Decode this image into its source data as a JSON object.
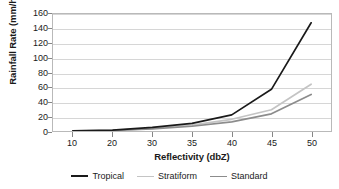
{
  "chart_data": {
    "type": "line",
    "title": "",
    "xlabel": "Reflectivity (dbZ)",
    "ylabel": "Rainfall Rate (mm/hr)",
    "categories": [
      "10",
      "20",
      "30",
      "35",
      "40",
      "45",
      "50"
    ],
    "x": [
      10,
      20,
      30,
      35,
      40,
      45,
      50
    ],
    "ylim": [
      0,
      160
    ],
    "yticks": [
      0,
      20,
      40,
      60,
      80,
      100,
      120,
      140,
      160
    ],
    "ytick_labels": [
      "0",
      "20",
      "40",
      "60",
      "80",
      "100",
      "120",
      "140",
      "160"
    ],
    "grid": true,
    "grid_axis": "y",
    "legend_position": "bottom",
    "series": [
      {
        "name": "Tropical",
        "color": "#1a1a1a",
        "width": 1.7,
        "values": [
          0.3,
          1.2,
          5.0,
          10.5,
          22.0,
          57.0,
          148.0
        ]
      },
      {
        "name": "Stratiform",
        "color": "#c4c4c4",
        "width": 1.7,
        "values": [
          0.2,
          0.8,
          3.5,
          8.0,
          16.0,
          29.0,
          64.0
        ]
      },
      {
        "name": "Standard",
        "color": "#8c8c8c",
        "width": 1.7,
        "values": [
          0.2,
          0.7,
          3.0,
          6.5,
          12.5,
          23.5,
          50.0
        ]
      }
    ]
  },
  "axis": {
    "y_title": "Rainfall Rate (mm/hr)",
    "x_title": "Reflectivity (dbZ)"
  },
  "legend": {
    "items": [
      {
        "label": "Tropical",
        "color": "#1a1a1a"
      },
      {
        "label": "Stratiform",
        "color": "#c4c4c4"
      },
      {
        "label": "Standard",
        "color": "#8c8c8c"
      }
    ]
  },
  "colors": {
    "background": "#ffffff",
    "gridline": "#d6d6d6",
    "frame": "#b9b9b9",
    "text": "#1a1a1a",
    "tropical": "#1a1a1a",
    "stratiform": "#c4c4c4",
    "standard": "#8c8c8c"
  }
}
